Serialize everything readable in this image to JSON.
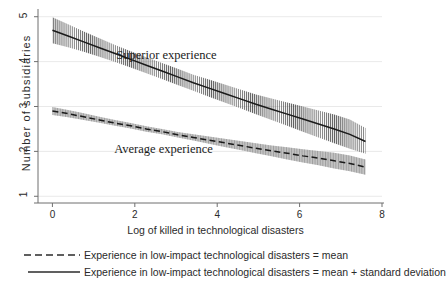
{
  "chart_data": {
    "type": "line",
    "title": "",
    "xlabel": "Log of killed in technological disasters",
    "ylabel": "Number of subsidiaries",
    "xlim": [
      -0.35,
      8.0
    ],
    "ylim": [
      0.85,
      5.15
    ],
    "xticks": [
      "0",
      "2",
      "4",
      "6",
      "8"
    ],
    "xtick_values": [
      0,
      2,
      4,
      6,
      8
    ],
    "yticks": [
      "1",
      "2",
      "3",
      "4",
      "5"
    ],
    "ytick_values": [
      1,
      2,
      3,
      4,
      5
    ],
    "grid": "horizontal",
    "legend_position": "below",
    "x": [
      0.0,
      0.38,
      0.76,
      1.14,
      1.52,
      1.9,
      2.28,
      2.66,
      3.04,
      3.42,
      3.8,
      4.18,
      4.56,
      4.94,
      5.32,
      5.7,
      6.08,
      6.46,
      6.84,
      7.22,
      7.6
    ],
    "series": [
      {
        "name": "Experience in low-impact technological disasters = mean + standard deviation",
        "label": "Superior experience",
        "style": "solid",
        "band_style": "hatched",
        "values": [
          4.7,
          4.57,
          4.44,
          4.31,
          4.18,
          4.05,
          3.92,
          3.79,
          3.66,
          3.53,
          3.41,
          3.29,
          3.17,
          3.05,
          2.94,
          2.83,
          2.72,
          2.61,
          2.5,
          2.38,
          2.22
        ],
        "ci_lower": [
          4.41,
          4.32,
          4.22,
          4.11,
          3.99,
          3.87,
          3.74,
          3.61,
          3.48,
          3.35,
          3.22,
          3.09,
          2.96,
          2.83,
          2.7,
          2.57,
          2.44,
          2.31,
          2.18,
          2.06,
          1.95
        ],
        "ci_upper": [
          4.99,
          4.83,
          4.67,
          4.52,
          4.37,
          4.23,
          4.1,
          3.97,
          3.84,
          3.71,
          3.6,
          3.49,
          3.38,
          3.27,
          3.18,
          3.09,
          3.0,
          2.91,
          2.82,
          2.71,
          2.52
        ]
      },
      {
        "name": "Experience in low-impact technological disasters = mean",
        "label": "Average experience",
        "style": "dashed",
        "band_style": "shaded",
        "values": [
          2.9,
          2.84,
          2.77,
          2.7,
          2.63,
          2.57,
          2.5,
          2.44,
          2.37,
          2.31,
          2.25,
          2.19,
          2.13,
          2.07,
          2.01,
          1.96,
          1.9,
          1.85,
          1.79,
          1.73,
          1.65
        ],
        "ci_lower": [
          2.81,
          2.76,
          2.7,
          2.64,
          2.57,
          2.51,
          2.44,
          2.38,
          2.31,
          2.24,
          2.17,
          2.1,
          2.03,
          1.96,
          1.89,
          1.82,
          1.75,
          1.69,
          1.62,
          1.56,
          1.48
        ],
        "ci_upper": [
          2.99,
          2.92,
          2.85,
          2.77,
          2.7,
          2.63,
          2.56,
          2.5,
          2.43,
          2.38,
          2.33,
          2.28,
          2.23,
          2.18,
          2.13,
          2.09,
          2.05,
          2.01,
          1.97,
          1.91,
          1.82
        ]
      }
    ],
    "annotations": [
      {
        "text": "Superior experience",
        "x": 1.55,
        "y": 4.12
      },
      {
        "text": "Average experience",
        "x": 1.5,
        "y": 2.02
      }
    ],
    "legend": [
      {
        "style": "dashed",
        "text": "Experience in low-impact technological disasters = mean"
      },
      {
        "style": "solid",
        "text": "Experience in low-impact technological disasters = mean + standard deviation"
      }
    ],
    "colors": {
      "line": "#1a1a1a",
      "band_shaded": "#b8b8b8",
      "band_hatch": "#4a4a4a",
      "axis": "#6f6f6f",
      "grid": "#e6e6e6",
      "text": "#2a2a2a",
      "background": "#ffffff"
    }
  }
}
